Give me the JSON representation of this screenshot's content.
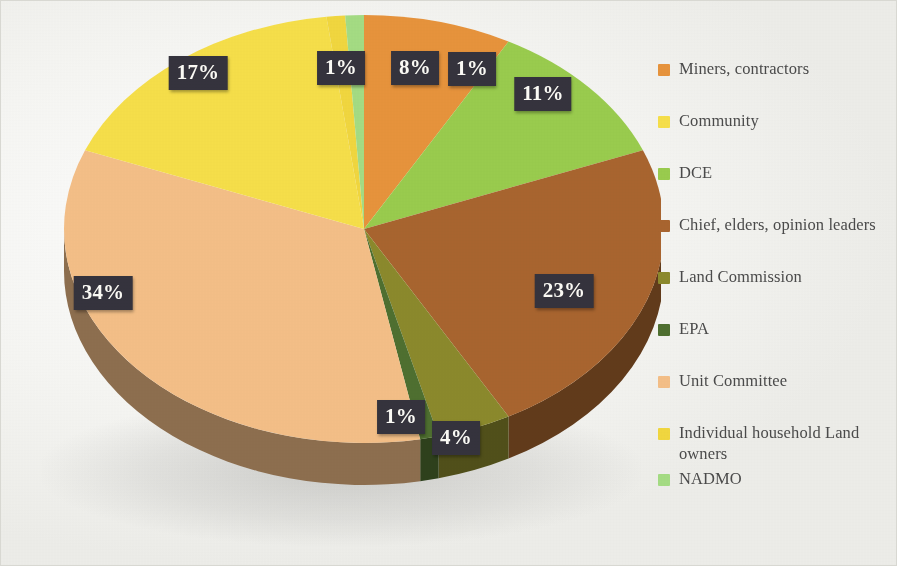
{
  "figure": {
    "background_color": "#f7f7f4",
    "label_box_color": "#35333d",
    "label_text_color": "#fdfcf7"
  },
  "chart_data": {
    "type": "pie",
    "title": "",
    "subtitle": "",
    "xlabel": "",
    "ylabel": "",
    "grid": false,
    "legend_position": "right",
    "three_d": true,
    "start_angle_deg": 0,
    "direction": "clockwise",
    "categories": [
      "Miners, contractors",
      "Community",
      "DCE",
      "Chief, elders, opinion leaders",
      "Land Commission",
      "EPA",
      "Unit Committee",
      "Individual household Land owners",
      "NADMO"
    ],
    "values": [
      8,
      17,
      11,
      23,
      4,
      1,
      34,
      1,
      1
    ],
    "value_labels": [
      "8%",
      "17%",
      "11%",
      "23%",
      "4%",
      "1%",
      "34%",
      "1%",
      "1%"
    ],
    "colors": [
      "#e8943c",
      "#f7e04a",
      "#9acd4e",
      "#a9652f",
      "#8c8a2c",
      "#4f7030",
      "#f5c088",
      "#f2d83f",
      "#a5dd84"
    ],
    "side_colors": [
      "#a9691f",
      "#b9a420",
      "#6f9830",
      "#7a4520",
      "#63621c",
      "#33491f",
      "#b88a58",
      "#b3a024",
      "#76a65e"
    ],
    "slices": [
      {
        "label": "Miners, contractors",
        "value": 8,
        "display": "8%",
        "color": "#e8943c"
      },
      {
        "label": "DCE",
        "value": 11,
        "display": "11%",
        "color": "#9acd4e"
      },
      {
        "label": "Chief, elders, opinion leaders",
        "value": 23,
        "display": "23%",
        "color": "#a9652f"
      },
      {
        "label": "Land Commission",
        "value": 4,
        "display": "4%",
        "color": "#8c8a2c"
      },
      {
        "label": "EPA",
        "value": 1,
        "display": "1%",
        "color": "#4f7030"
      },
      {
        "label": "Unit Committee",
        "value": 34,
        "display": "34%",
        "color": "#f5c088"
      },
      {
        "label": "Community",
        "value": 17,
        "display": "17%",
        "color": "#f7e04a"
      },
      {
        "label": "Individual household Land owners",
        "value": 1,
        "display": "1%",
        "color": "#f2d83f"
      },
      {
        "label": "NADMO",
        "value": 1,
        "display": "1%",
        "color": "#a5dd84"
      }
    ]
  },
  "data_labels": [
    {
      "text": "1%",
      "x": 340,
      "y": 67,
      "of": "Individual household Land owners"
    },
    {
      "text": "8%",
      "x": 414,
      "y": 67,
      "of": "Miners, contractors"
    },
    {
      "text": "1%",
      "x": 471,
      "y": 68,
      "of": "NADMO"
    },
    {
      "text": "11%",
      "x": 542,
      "y": 93,
      "of": "DCE"
    },
    {
      "text": "23%",
      "x": 563,
      "y": 290,
      "of": "Chief, elders, opinion leaders"
    },
    {
      "text": "4%",
      "x": 455,
      "y": 437,
      "of": "Land Commission"
    },
    {
      "text": "1%",
      "x": 400,
      "y": 416,
      "of": "EPA"
    },
    {
      "text": "34%",
      "x": 102,
      "y": 292,
      "of": "Unit Committee"
    },
    {
      "text": "17%",
      "x": 197,
      "y": 72,
      "of": "Community"
    }
  ],
  "legend": {
    "items": [
      {
        "label": "Miners, contractors",
        "color": "#e8943c"
      },
      {
        "label": "Community",
        "color": "#f7e04a"
      },
      {
        "label": "DCE",
        "color": "#9acd4e"
      },
      {
        "label": "Chief, elders, opinion leaders",
        "color": "#a9652f"
      },
      {
        "label": "Land Commission",
        "color": "#8c8a2c"
      },
      {
        "label": "EPA",
        "color": "#4f7030"
      },
      {
        "label": "Unit Committee",
        "color": "#f5c088"
      },
      {
        "label": "Individual household Land owners",
        "color": "#f2d83f"
      },
      {
        "label": "NADMO",
        "color": "#a5dd84"
      }
    ]
  }
}
